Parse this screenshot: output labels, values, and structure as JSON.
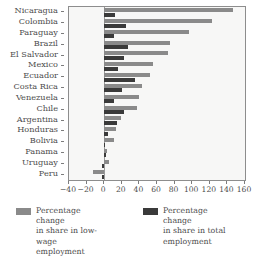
{
  "chart_data": {
    "type": "bar",
    "orientation": "horizontal",
    "title": "",
    "subtitle": "",
    "xlabel": "",
    "ylabel": "",
    "xlim": [
      -40,
      160
    ],
    "xticks": [
      -40,
      -20,
      0,
      20,
      40,
      60,
      80,
      100,
      120,
      140,
      160
    ],
    "xtick_labels": [
      "−40",
      "−20",
      "0",
      "20",
      "40",
      "60",
      "80",
      "100",
      "120",
      "140",
      "160"
    ],
    "grid": false,
    "legend_position": "bottom",
    "categories": [
      "Nicaragua",
      "Colombia",
      "Paraguay",
      "Brazil",
      "El Salvador",
      "Mexico",
      "Ecuador",
      "Costa Rica",
      "Venezuela",
      "Chile",
      "Argentina",
      "Honduras",
      "Bolivia",
      "Panama",
      "Uruguay",
      "Peru"
    ],
    "series": [
      {
        "name": "Percentage change in share in low-wage employment",
        "color": "#8a8a8a",
        "values": [
          146,
          122,
          96,
          75,
          73,
          56,
          52,
          43,
          40,
          37,
          19,
          13,
          11,
          3,
          6,
          -13
        ]
      },
      {
        "name": "Percentage change in share in total employment",
        "color": "#3a3a3a",
        "values": [
          12,
          25,
          11,
          27,
          22,
          16,
          35,
          20,
          11,
          22,
          15,
          4,
          1,
          2,
          -3,
          -2
        ]
      }
    ]
  },
  "legend": {
    "entries": [
      {
        "label_line1": "Percentage change",
        "label_line2": "in share in low-wage",
        "label_line3": "employment"
      },
      {
        "label_line1": "Percentage change",
        "label_line2": "in share in total",
        "label_line3": "employment"
      }
    ]
  }
}
